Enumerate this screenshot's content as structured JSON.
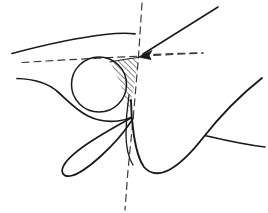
{
  "figure": {
    "canvas": {
      "width": 268,
      "height": 213,
      "background": "#ffffff"
    },
    "colors": {
      "ink": "#1a1a1a",
      "dashed_ink": "#3a3a3a",
      "hatch": "#1a1a1a",
      "background": "#ffffff"
    },
    "intersection_point": {
      "x": 138,
      "y": 57
    },
    "elements": {
      "circle_label": "inscribed-circle",
      "hatched_region_label": "hatched-corner-region",
      "arrow_label": "annotation-arrow",
      "cusp_label": "curve-cusp",
      "loop_label": "narrow-loop",
      "branch_label": "curve-branch"
    },
    "geometry": {
      "circle": {
        "cx": 99,
        "cy": 84.5,
        "r": 27.5
      },
      "arrow": {
        "tail": {
          "x": 218,
          "y": 7
        },
        "head": {
          "x": 140,
          "y": 56
        }
      },
      "dashed_vertical": {
        "x1": 142,
        "y1": 3,
        "x2": 125,
        "y2": 210
      },
      "dashed_horizontal": {
        "x1": 22,
        "y1": 62,
        "x2": 203,
        "y2": 53
      },
      "upper_arc": {
        "start": {
          "x": 12,
          "y": 53
        },
        "end": {
          "x": 135,
          "y": 34
        }
      },
      "lower_left_curve_start": {
        "x": 17,
        "y": 78
      },
      "upper_right_curve_end": {
        "x": 262,
        "y": 78
      },
      "branch_end": {
        "x": 265,
        "y": 147
      },
      "loop_tip": {
        "x": 66,
        "y": 172
      }
    },
    "hatch": {
      "angle_degrees": 45,
      "spacing": 4,
      "stroke_width": 1
    }
  }
}
